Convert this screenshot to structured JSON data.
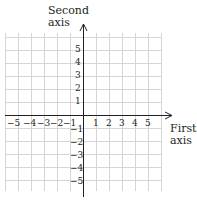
{
  "diagram": {
    "type": "coordinate-plane",
    "x_axis": {
      "title_line1": "First",
      "title_line2": "axis",
      "ticks": [
        "−5",
        "−4",
        "−3",
        "−2",
        "−1",
        "1",
        "2",
        "3",
        "4",
        "5"
      ]
    },
    "y_axis": {
      "title_line1": "Second",
      "title_line2": "axis",
      "ticks": [
        "5",
        "4",
        "3",
        "2",
        "1",
        "−1",
        "−2",
        "−3",
        "−4",
        "−5"
      ]
    },
    "grid": {
      "min": -6,
      "max": 6,
      "color": "#d9d9d9"
    },
    "axis_color": "#231f20"
  }
}
